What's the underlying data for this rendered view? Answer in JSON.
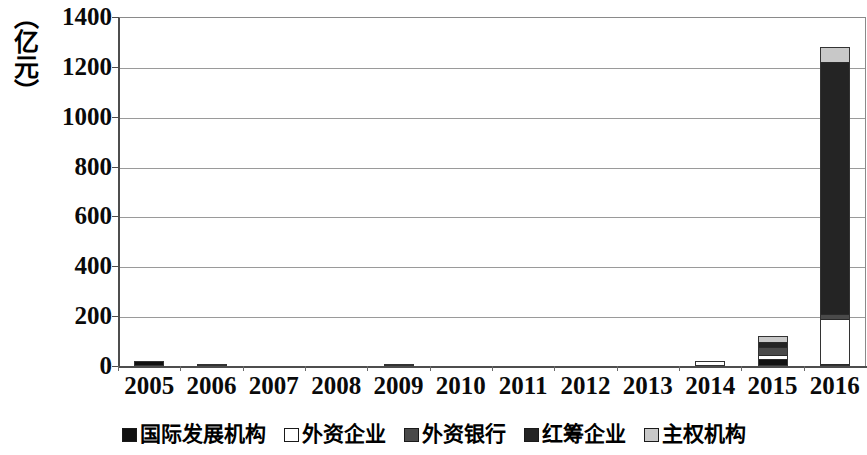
{
  "chart_data": {
    "type": "bar",
    "stacked": true,
    "title": "",
    "subtitle": "",
    "xlabel": "",
    "ylabel": "（亿元）",
    "ylim": [
      0,
      1400
    ],
    "ytick_step": 200,
    "ytick_labels": [
      "1400",
      "1200",
      "1000",
      "800",
      "600",
      "400",
      "200",
      "0"
    ],
    "ytick_values": [
      1400,
      1200,
      1000,
      800,
      600,
      400,
      200,
      0
    ],
    "grid": true,
    "grid_axis": "y",
    "legend_position": "bottom",
    "categories": [
      "2005",
      "2006",
      "2007",
      "2008",
      "2009",
      "2010",
      "2011",
      "2012",
      "2013",
      "2014",
      "2015",
      "2016"
    ],
    "series": [
      {
        "name": "国际发展机构",
        "color": "#111111",
        "values": [
          20,
          8,
          0,
          0,
          10,
          0,
          0,
          0,
          0,
          0,
          30,
          10
        ]
      },
      {
        "name": "外资企业",
        "color": "#ffffff",
        "values": [
          0,
          0,
          0,
          0,
          0,
          0,
          0,
          0,
          0,
          20,
          15,
          180
        ]
      },
      {
        "name": "外资银行",
        "color": "#4a4a4a",
        "values": [
          0,
          0,
          0,
          0,
          0,
          0,
          0,
          0,
          0,
          0,
          30,
          20
        ]
      },
      {
        "name": "红筹企业",
        "color": "#242424",
        "values": [
          0,
          0,
          0,
          0,
          0,
          0,
          0,
          0,
          0,
          0,
          20,
          1010
        ]
      },
      {
        "name": "主权机构",
        "color": "#c8c8c8",
        "values": [
          0,
          0,
          0,
          0,
          0,
          0,
          0,
          0,
          0,
          0,
          25,
          60
        ]
      }
    ],
    "totals": [
      20,
      8,
      0,
      0,
      10,
      0,
      0,
      0,
      0,
      20,
      120,
      1280
    ]
  },
  "legend": {
    "items": [
      {
        "label": "国际发展机构",
        "color": "#111111"
      },
      {
        "label": "外资企业",
        "color": "#ffffff"
      },
      {
        "label": "外资银行",
        "color": "#4a4a4a"
      },
      {
        "label": "红筹企业",
        "color": "#242424"
      },
      {
        "label": "主权机构",
        "color": "#c8c8c8"
      }
    ]
  },
  "axes": {
    "y_title": "（亿元）",
    "y_ticks": [
      "1400",
      "1200",
      "1000",
      "800",
      "600",
      "400",
      "200",
      "0"
    ],
    "x_ticks": [
      "2005",
      "2006",
      "2007",
      "2008",
      "2009",
      "2010",
      "2011",
      "2012",
      "2013",
      "2014",
      "2015",
      "2016"
    ]
  },
  "colors": {
    "axis": "#4d4d4d",
    "gridline": "#9a9a9a",
    "text": "#0a0a0a",
    "background": "#ffffff"
  }
}
